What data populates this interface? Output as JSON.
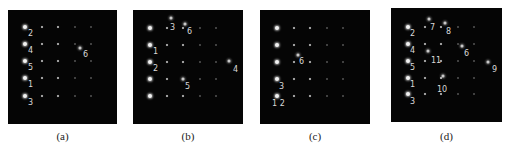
{
  "figure": {
    "background": "#ffffff",
    "panel_background": "#050505",
    "panels": [
      {
        "id": "a",
        "caption": "(a)",
        "box": {
          "x": 8,
          "y": 10,
          "w": 109,
          "h": 114
        },
        "grid": {
          "cols": [
            17,
            34,
            50,
            67,
            83
          ],
          "rows": [
            17,
            34,
            51,
            68,
            86
          ]
        },
        "labels": [
          {
            "text": "2",
            "x": 20,
            "y": 20
          },
          {
            "text": "4",
            "x": 20,
            "y": 37
          },
          {
            "text": "5",
            "x": 20,
            "y": 54
          },
          {
            "text": "1",
            "x": 20,
            "y": 71
          },
          {
            "text": "3",
            "x": 20,
            "y": 89
          },
          {
            "text": "6",
            "x": 75,
            "y": 41
          }
        ],
        "extra_spots": [
          {
            "x": 72,
            "y": 38
          }
        ]
      },
      {
        "id": "b",
        "caption": "(b)",
        "box": {
          "x": 133,
          "y": 10,
          "w": 110,
          "h": 114
        },
        "grid": {
          "cols": [
            17,
            34,
            50,
            67,
            83
          ],
          "rows": [
            18,
            35,
            52,
            69,
            86
          ]
        },
        "labels": [
          {
            "text": "3",
            "x": 37,
            "y": 14
          },
          {
            "text": "6",
            "x": 54,
            "y": 18
          },
          {
            "text": "1",
            "x": 20,
            "y": 38
          },
          {
            "text": "2",
            "x": 20,
            "y": 55
          },
          {
            "text": "4",
            "x": 100,
            "y": 56
          },
          {
            "text": "5",
            "x": 52,
            "y": 73
          }
        ],
        "extra_spots": [
          {
            "x": 38,
            "y": 8
          },
          {
            "x": 52,
            "y": 14
          },
          {
            "x": 96,
            "y": 51
          },
          {
            "x": 50,
            "y": 69
          }
        ]
      },
      {
        "id": "c",
        "caption": "(c)",
        "box": {
          "x": 260,
          "y": 10,
          "w": 110,
          "h": 114
        },
        "grid": {
          "cols": [
            17,
            34,
            50,
            67,
            83
          ],
          "rows": [
            18,
            35,
            52,
            69,
            86
          ]
        },
        "labels": [
          {
            "text": "6",
            "x": 39,
            "y": 48
          },
          {
            "text": "3",
            "x": 19,
            "y": 73
          },
          {
            "text": "1 2",
            "x": 12,
            "y": 90
          }
        ],
        "extra_spots": [
          {
            "x": 38,
            "y": 45
          }
        ]
      },
      {
        "id": "d",
        "caption": "(d)",
        "box": {
          "x": 391,
          "y": 8,
          "w": 111,
          "h": 114
        },
        "grid": {
          "cols": [
            17,
            34,
            50,
            67,
            83
          ],
          "rows": [
            19,
            36,
            53,
            70,
            86
          ]
        },
        "labels": [
          {
            "text": "2",
            "x": 19,
            "y": 22
          },
          {
            "text": "7",
            "x": 39,
            "y": 16
          },
          {
            "text": "8",
            "x": 55,
            "y": 20
          },
          {
            "text": "4",
            "x": 19,
            "y": 39
          },
          {
            "text": "6",
            "x": 73,
            "y": 42
          },
          {
            "text": "11",
            "x": 40,
            "y": 49
          },
          {
            "text": "5",
            "x": 19,
            "y": 56
          },
          {
            "text": "9",
            "x": 101,
            "y": 58
          },
          {
            "text": "1",
            "x": 19,
            "y": 73
          },
          {
            "text": "10",
            "x": 46,
            "y": 78
          },
          {
            "text": "3",
            "x": 19,
            "y": 90
          }
        ],
        "extra_spots": [
          {
            "x": 38,
            "y": 11
          },
          {
            "x": 54,
            "y": 15
          },
          {
            "x": 71,
            "y": 38
          },
          {
            "x": 37,
            "y": 43
          },
          {
            "x": 97,
            "y": 54
          },
          {
            "x": 52,
            "y": 68
          }
        ]
      }
    ]
  }
}
